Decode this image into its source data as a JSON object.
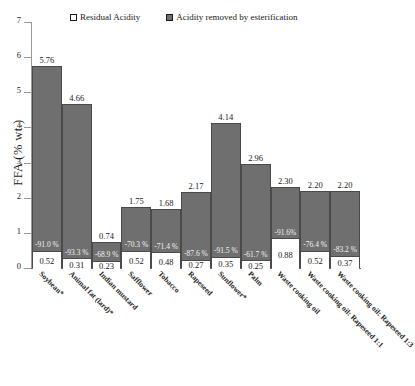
{
  "chart_data": {
    "type": "bar",
    "title": "",
    "subtitle": "",
    "xlabel": "",
    "ylabel": "FFA (% wt.)",
    "ylim": [
      0,
      7
    ],
    "yticks": [
      "0",
      "1",
      "2",
      "3",
      "4",
      "5",
      "6",
      "7"
    ],
    "grid": false,
    "legend_position": "top",
    "stacked": true,
    "categories": [
      "Soybean*",
      "Animal fat (lard)*",
      "Indian mustard",
      "Safflower",
      "Tobacco",
      "Rapeseed",
      "Sunflower*",
      "Palm",
      "Waste cooking oil",
      "Waste cooking oil: Rapeseed 1:1",
      "Waste cooking oil: Rapeseed 1:3"
    ],
    "series": [
      {
        "name": "Residual Acidity",
        "color": "#ffffff",
        "values": [
          0.52,
          0.31,
          0.23,
          0.52,
          0.48,
          0.27,
          0.35,
          0.25,
          0.88,
          0.52,
          0.37
        ]
      },
      {
        "name": "Acidity removed by esterification",
        "color": "#6f6f6f",
        "values": [
          5.24,
          4.35,
          0.51,
          1.23,
          1.2,
          1.9,
          3.79,
          2.71,
          1.42,
          1.68,
          1.83
        ]
      }
    ],
    "totals": [
      5.76,
      4.66,
      0.74,
      1.75,
      1.68,
      2.17,
      4.14,
      2.96,
      2.3,
      2.2,
      2.2
    ],
    "total_labels": [
      "5.76",
      "4.66",
      "0.74",
      "1.75",
      "1.68",
      "2.17",
      "4.14",
      "2.96",
      "2.30",
      "2.20",
      "2.20"
    ],
    "residual_labels": [
      "0.52",
      "0.31",
      "0.23",
      "0.52",
      "0.48",
      "0.27",
      "0.35",
      "0.25",
      "0.88",
      "0.52",
      "0.37"
    ],
    "reduction_labels": [
      "-91.0 %",
      "-93.3 %",
      "-68.9 %",
      "-70.3 %",
      "-71.4 %",
      "-87.6 %",
      "-91.5 %",
      "-61.7 %",
      "-91.6%",
      "-76.4 %",
      "-83.2 %"
    ]
  },
  "legend": {
    "items": [
      {
        "label": "Residual Acidity",
        "swatch": "open-square-icon"
      },
      {
        "label": "Acidity removed by esterification",
        "swatch": "filled-square-icon"
      }
    ]
  },
  "colors": {
    "bar_fill": "#6f6f6f",
    "bar_stroke": "#4a4a4a",
    "residual_fill": "#ffffff",
    "axis": "#9a9a9a",
    "text": "#1a1a1a"
  }
}
